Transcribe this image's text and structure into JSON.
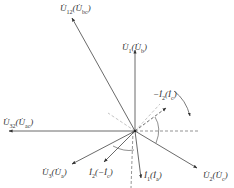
{
  "diagram": {
    "type": "phasor-diagram",
    "colors": {
      "line": "#444444",
      "dashed": "#666666",
      "light_dashed": "#aaaaaa"
    },
    "phasors": [
      {
        "id": "U12",
        "label": "U̇12(U̇bc)",
        "main": "U̇",
        "sub": "12",
        "alt_main": "U̇",
        "alt_sub": "bc",
        "style": "solid"
      },
      {
        "id": "U1",
        "label": "U̇1(U̇b)",
        "main": "U̇",
        "sub": "1",
        "alt_main": "U̇",
        "alt_sub": "b",
        "style": "solid"
      },
      {
        "id": "U32",
        "label": "U̇32(U̇ac)",
        "main": "U̇",
        "sub": "32",
        "alt_main": "U̇",
        "alt_sub": "ac",
        "style": "solid"
      },
      {
        "id": "U3",
        "label": "U̇3(U̇a)",
        "main": "U̇",
        "sub": "3",
        "alt_main": "U̇",
        "alt_sub": "a",
        "style": "solid"
      },
      {
        "id": "I2",
        "label": "İ2(−İc)",
        "main": "İ",
        "sub": "2",
        "alt_main": "−İ",
        "alt_sub": "c",
        "style": "solid"
      },
      {
        "id": "I1",
        "label": "İ1(İa)",
        "main": "İ",
        "sub": "1",
        "alt_main": "İ",
        "alt_sub": "a",
        "style": "solid"
      },
      {
        "id": "U2",
        "label": "U̇2(U̇c)",
        "main": "U̇",
        "sub": "2",
        "alt_main": "U̇",
        "alt_sub": "c",
        "style": "solid"
      },
      {
        "id": "mI2",
        "label": "−İ2(İc)",
        "main": "−İ",
        "sub": "2",
        "alt_main": "İ",
        "alt_sub": "c",
        "style": "dashed"
      }
    ],
    "rotation": "clockwise"
  }
}
